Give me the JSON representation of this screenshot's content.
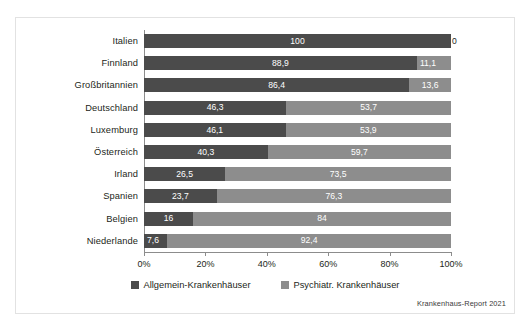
{
  "chart_data": {
    "type": "bar",
    "orientation": "horizontal",
    "stacked": true,
    "normalized_percent": true,
    "title": "",
    "subtitle": "",
    "xlabel": "",
    "ylabel": "",
    "xlim": [
      0,
      100
    ],
    "xticks": [
      "0%",
      "20%",
      "40%",
      "60%",
      "80%",
      "100%"
    ],
    "xtick_values": [
      0,
      20,
      40,
      60,
      80,
      100
    ],
    "grid": false,
    "legend_position": "bottom-center",
    "categories": [
      "Italien",
      "Finnland",
      "Großbritannien",
      "Deutschland",
      "Luxemburg",
      "Österreich",
      "Irland",
      "Spanien",
      "Belgien",
      "Niederlande"
    ],
    "series": [
      {
        "name": "Allgemein-Krankenhäuser",
        "color": "#4b4b4b",
        "values": [
          100,
          88.9,
          86.4,
          46.3,
          46.1,
          40.3,
          26.5,
          23.7,
          16,
          7.6
        ],
        "labels": [
          "100",
          "88,9",
          "86,4",
          "46,3",
          "46,1",
          "40,3",
          "26,5",
          "23,7",
          "16",
          "7,6"
        ]
      },
      {
        "name": "Psychiatr. Krankenhäuser",
        "color": "#8d8d8d",
        "values": [
          0,
          11.1,
          13.6,
          53.7,
          53.9,
          59.7,
          73.5,
          76.3,
          84,
          92.4
        ],
        "labels": [
          "0",
          "11,1",
          "13,6",
          "53,7",
          "53,9",
          "59,7",
          "73,5",
          "76,3",
          "84",
          "92,4"
        ]
      }
    ],
    "source_note": "Krankenhaus-Report 2021"
  }
}
